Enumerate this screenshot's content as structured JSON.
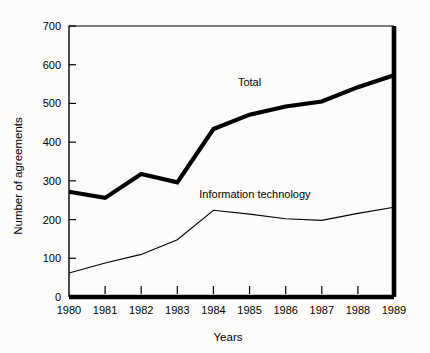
{
  "chart_data": {
    "type": "line",
    "title": "",
    "xlabel": "Years",
    "ylabel": "Number of agreements",
    "x": [
      1980,
      1981,
      1982,
      1983,
      1984,
      1985,
      1986,
      1987,
      1988,
      1989
    ],
    "xtick_labels": [
      "1980",
      "1981",
      "1982",
      "1983",
      "1984",
      "1985",
      "1986",
      "1987",
      "1988",
      "1989"
    ],
    "ytick_labels": [
      "0",
      "100",
      "200",
      "300",
      "400",
      "500",
      "600",
      "700"
    ],
    "yticks": [
      0,
      100,
      200,
      300,
      400,
      500,
      600,
      700
    ],
    "xlim": [
      1980,
      1989
    ],
    "ylim": [
      0,
      700
    ],
    "grid": false,
    "legend_position": "inline-annotation",
    "series": [
      {
        "name": "Total",
        "label": "Total",
        "label_x": 1985.0,
        "label_y": 545,
        "color": "#000000",
        "line_width": 4.2,
        "values": [
          272,
          256,
          318,
          296,
          434,
          471,
          492,
          505,
          542,
          573
        ]
      },
      {
        "name": "Information technology",
        "label": "Information technology",
        "label_x": 1985.15,
        "label_y": 256,
        "color": "#000000",
        "line_width": 1.1,
        "values": [
          62,
          88,
          110,
          148,
          224,
          214,
          202,
          198,
          216,
          232
        ]
      }
    ]
  }
}
